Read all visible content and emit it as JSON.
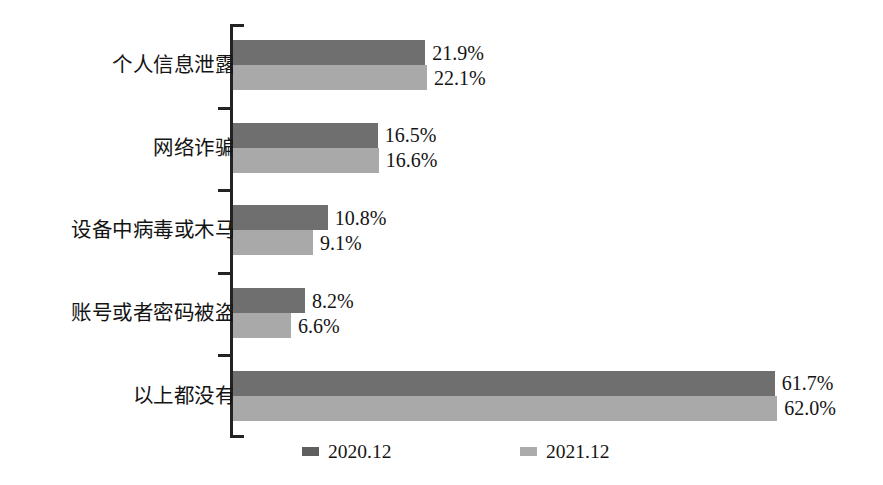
{
  "chart_data": {
    "type": "bar",
    "orientation": "horizontal",
    "title": "",
    "xlabel": "",
    "ylabel": "",
    "grid": false,
    "legend_position": "bottom",
    "xlim": [
      0,
      70
    ],
    "categories": [
      "个人信息泄露",
      "网络诈骗",
      "设备中病毒或木马",
      "账号或者密码被盗",
      "以上都没有"
    ],
    "series": [
      {
        "name": "2020.12",
        "color": "#6f6f6f",
        "values": [
          21.9,
          16.5,
          10.8,
          8.2,
          61.7
        ],
        "labels": [
          "21.9%",
          "16.5%",
          "10.8%",
          "8.2%",
          "61.7%"
        ]
      },
      {
        "name": "2021.12",
        "color": "#a9a9a9",
        "values": [
          22.1,
          16.6,
          9.1,
          6.6,
          62.0
        ],
        "labels": [
          "22.1%",
          "16.6%",
          "9.1%",
          "6.6%",
          "62.0%"
        ]
      }
    ]
  },
  "legend": {
    "items": [
      {
        "label": "2020.12",
        "color": "#6f6f6f"
      },
      {
        "label": "2021.12",
        "color": "#a9a9a9"
      }
    ]
  }
}
